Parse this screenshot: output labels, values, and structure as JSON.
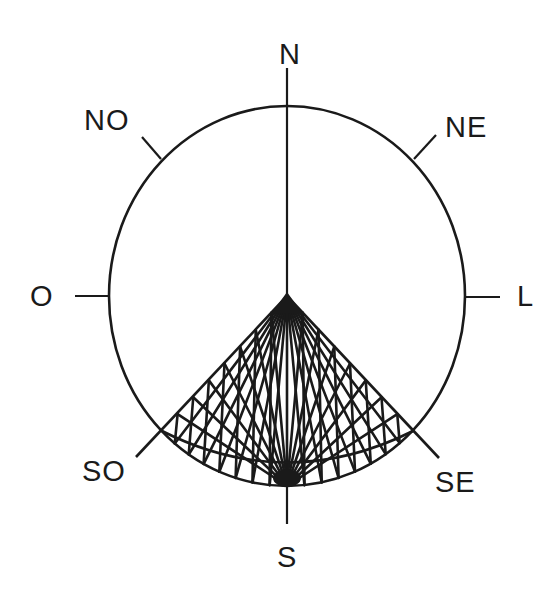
{
  "diagram": {
    "type": "compass-rose",
    "colors": {
      "stroke": "#1a1a1a",
      "background": "#ffffff"
    },
    "center": [
      287,
      296
    ],
    "radius_x": 178,
    "radius_y": 190,
    "directions": {
      "N": {
        "label": "N",
        "pos": [
          279,
          40
        ]
      },
      "NE": {
        "label": "NE",
        "pos": [
          445,
          113
        ]
      },
      "L": {
        "label": "L",
        "pos": [
          517,
          282
        ]
      },
      "SE": {
        "label": "SE",
        "pos": [
          435,
          468
        ]
      },
      "S": {
        "label": "S",
        "pos": [
          277,
          543
        ]
      },
      "SO": {
        "label": "SO",
        "pos": [
          82,
          457
        ]
      },
      "O": {
        "label": "O",
        "pos": [
          30,
          282
        ]
      },
      "NO": {
        "label": "NO",
        "pos": [
          84,
          106
        ]
      }
    },
    "highlighted_sector": {
      "from": "SO",
      "to": "SE",
      "description": "Hatched sector between SO and SE (southern quadrant)",
      "fill_style": "string-art web"
    }
  }
}
